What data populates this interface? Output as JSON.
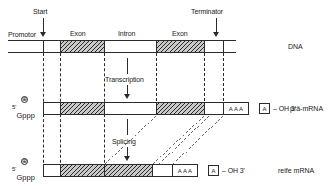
{
  "diagram": {
    "title_implicit": "Transkription und Splicing",
    "language": "de"
  },
  "dna_row": {
    "row_label": "DNA",
    "markers": [
      {
        "name": "start",
        "label": "Start"
      },
      {
        "name": "terminator",
        "label": "Terminator"
      }
    ],
    "segment_labels": [
      {
        "name": "promotor",
        "label": "Promotor"
      },
      {
        "name": "exon-1",
        "label": "Exon"
      },
      {
        "name": "intron",
        "label": "Intron"
      },
      {
        "name": "exon-2",
        "label": "Exon"
      }
    ],
    "segments": [
      {
        "kind": "plain",
        "label": ""
      },
      {
        "kind": "exon",
        "label": "Exon"
      },
      {
        "kind": "plain",
        "label": "Intron"
      },
      {
        "kind": "exon",
        "label": "Exon"
      },
      {
        "kind": "plain",
        "label": ""
      }
    ]
  },
  "process_arrows": [
    {
      "name": "transcription",
      "label": "Transcription"
    },
    {
      "name": "splicing",
      "label": "Splicing"
    }
  ],
  "pre_mrna_row": {
    "row_label": "prä-mRNA",
    "cap_five": "5'",
    "cap_text": "Gppp",
    "cap_charge": "⊕",
    "polya_label": "AAA",
    "tail_a": "A",
    "tail_text": "– OH 3'",
    "segments": [
      {
        "kind": "plain"
      },
      {
        "kind": "exon"
      },
      {
        "kind": "plain"
      },
      {
        "kind": "exon"
      },
      {
        "kind": "plain"
      }
    ]
  },
  "mature_mrna_row": {
    "row_label": "reife mRNA",
    "cap_five": "5'",
    "cap_text": "Gppp",
    "cap_charge": "⊕",
    "polya_label": "AAA",
    "tail_a": "A",
    "tail_text": "– OH 3'",
    "segments": [
      {
        "kind": "plain"
      },
      {
        "kind": "exon"
      },
      {
        "kind": "exon"
      },
      {
        "kind": "plain"
      }
    ]
  },
  "colors": {
    "ink": "#2b2b2b",
    "hatch": "#2b2b2b",
    "paper": "#ffffff"
  }
}
